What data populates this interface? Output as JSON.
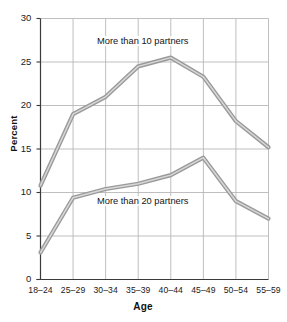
{
  "chart_data": {
    "type": "line",
    "title": "",
    "xlabel": "Age",
    "ylabel": "Percent",
    "categories": [
      "18–24",
      "25–29",
      "30–34",
      "35–39",
      "40–44",
      "45–49",
      "50–54",
      "55–59"
    ],
    "ylim": [
      0,
      30
    ],
    "yticks": [
      0,
      5,
      10,
      15,
      20,
      25,
      30
    ],
    "ytick_labels": [
      "0",
      "5",
      "10",
      "15",
      "20",
      "25",
      "30"
    ],
    "grid": true,
    "legend_position": "inline-annotation",
    "series": [
      {
        "name": "More than 10 partners",
        "annotation": "More than 10 partners",
        "values": [
          10.8,
          19.0,
          21.0,
          24.5,
          25.5,
          23.3,
          18.2,
          15.2
        ],
        "color": "#9a9a9a"
      },
      {
        "name": "More than 20 partners",
        "annotation": "More than 20 partners",
        "values": [
          3.1,
          9.4,
          10.4,
          11.0,
          12.0,
          14.0,
          9.0,
          7.0
        ],
        "color": "#9a9a9a"
      }
    ],
    "colors": {
      "line": "#9a9a9a",
      "line_highlight": "#d8d8d8",
      "grid": "#b8b8b8",
      "axis": "#3a3a3a",
      "text": "#141414",
      "background": "#ffffff"
    }
  }
}
